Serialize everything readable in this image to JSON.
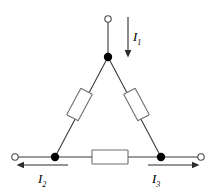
{
  "figure": {
    "background_color": "#ffffff",
    "line_color": "#3a3a3a",
    "node_color": "#000000",
    "resistor_fill": "#ffffff",
    "resistor_stroke": "#6e6e6e",
    "terminal_stroke": "#4a4a4a",
    "width": 216,
    "height": 194
  },
  "labels": {
    "i1": {
      "symbol": "I",
      "subscript": "1",
      "text": "I1"
    },
    "i2": {
      "symbol": "I",
      "subscript": "2",
      "text": "I2"
    },
    "i3": {
      "symbol": "I",
      "subscript": "3",
      "text": "I3"
    }
  },
  "arrows": {
    "i1": {
      "name": "current-arrow-i1",
      "direction": "down",
      "x": 128,
      "y_start": 17,
      "y_end": 57
    },
    "i2": {
      "name": "current-arrow-i2",
      "direction": "left",
      "y": 165,
      "x_start": 68,
      "x_end": 17
    },
    "i3": {
      "name": "current-arrow-i3",
      "direction": "right",
      "y": 165,
      "x_start": 148,
      "x_end": 199
    }
  },
  "nodes": [
    {
      "name": "node-top",
      "type": "junction",
      "x": 108,
      "y": 57,
      "r": 4.2
    },
    {
      "name": "node-bottom-left",
      "type": "junction",
      "x": 55,
      "y": 157,
      "r": 4.2
    },
    {
      "name": "node-bottom-right",
      "type": "junction",
      "x": 161,
      "y": 157,
      "r": 4.2
    }
  ],
  "terminals": [
    {
      "name": "terminal-top",
      "type": "open",
      "x": 108,
      "y": 19,
      "r": 3.2
    },
    {
      "name": "terminal-bottom-left",
      "type": "open",
      "x": 15,
      "y": 157,
      "r": 3.2
    },
    {
      "name": "terminal-bottom-right",
      "type": "open",
      "x": 201,
      "y": 157,
      "r": 3.2
    }
  ],
  "wires": [
    {
      "name": "wire-top-lead",
      "x1": 108,
      "y1": 22,
      "x2": 108,
      "y2": 57
    },
    {
      "name": "wire-left-branch",
      "x1": 108,
      "y1": 57,
      "x2": 55,
      "y2": 157
    },
    {
      "name": "wire-right-branch",
      "x1": 108,
      "y1": 57,
      "x2": 161,
      "y2": 157
    },
    {
      "name": "wire-bottom-left-lead",
      "x1": 18,
      "y1": 157,
      "x2": 55,
      "y2": 157
    },
    {
      "name": "wire-bottom-left-inner",
      "x1": 55,
      "y1": 157,
      "x2": 92,
      "y2": 157
    },
    {
      "name": "wire-bottom-right-inner",
      "x1": 128,
      "y1": 157,
      "x2": 161,
      "y2": 157
    },
    {
      "name": "wire-bottom-right-lead",
      "x1": 161,
      "y1": 157,
      "x2": 198,
      "y2": 157
    }
  ],
  "resistors": [
    {
      "name": "resistor-left",
      "cx": 79.5,
      "cy": 104.5,
      "w": 13,
      "h": 30,
      "rotation_deg": 28
    },
    {
      "name": "resistor-right",
      "cx": 136.5,
      "cy": 104.5,
      "w": 13,
      "h": 30,
      "rotation_deg": -28
    },
    {
      "name": "resistor-bottom",
      "cx": 110,
      "cy": 157,
      "w": 36,
      "h": 14,
      "rotation_deg": 0
    }
  ]
}
